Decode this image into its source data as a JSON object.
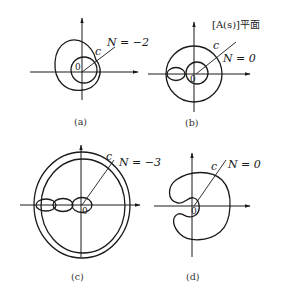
{
  "figure": {
    "plane_label": "[A(s)]平面",
    "panels": [
      {
        "id": "a",
        "caption": "(a)",
        "N_label": "N = −2",
        "contour_label": "c",
        "origin_label": "0"
      },
      {
        "id": "b",
        "caption": "(b)",
        "N_label": "N = 0",
        "contour_label": "c",
        "origin_label": "0"
      },
      {
        "id": "c",
        "caption": "(c)",
        "N_label": "N = −3",
        "contour_label": "c",
        "origin_label": "0"
      },
      {
        "id": "d",
        "caption": "(d)",
        "N_label": "N = 0",
        "contour_label": "c",
        "origin_label": "0"
      }
    ]
  }
}
